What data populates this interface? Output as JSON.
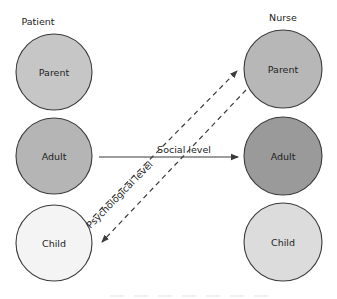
{
  "diagram": {
    "type": "transactional-analysis-crossed-ulterior-transaction",
    "columns": {
      "left": {
        "label": "Patient"
      },
      "right": {
        "label": "Nurse"
      }
    },
    "nodes": {
      "patient_parent": {
        "label": "Parent",
        "fill": "#c6c6c6"
      },
      "patient_adult": {
        "label": "Adult",
        "fill": "#b5b5b5"
      },
      "patient_child": {
        "label": "Child",
        "fill": "#f4f4f4"
      },
      "nurse_parent": {
        "label": "Parent",
        "fill": "#b7b7b7"
      },
      "nurse_adult": {
        "label": "Adult",
        "fill": "#9a9a9a"
      },
      "nurse_child": {
        "label": "Child",
        "fill": "#dcdcdc"
      }
    },
    "edges": [
      {
        "id": "social",
        "from": "patient_adult",
        "to": "nurse_adult",
        "style": "solid",
        "label": "Social level"
      },
      {
        "id": "psych_up",
        "from": "patient_child",
        "to": "nurse_parent",
        "style": "dashed",
        "label": "Psychological level"
      },
      {
        "id": "psych_down",
        "from": "nurse_parent",
        "to": "patient_child",
        "style": "dashed",
        "label": ""
      }
    ],
    "colors": {
      "stroke": "#3a3a3a",
      "text": "#222222"
    }
  }
}
